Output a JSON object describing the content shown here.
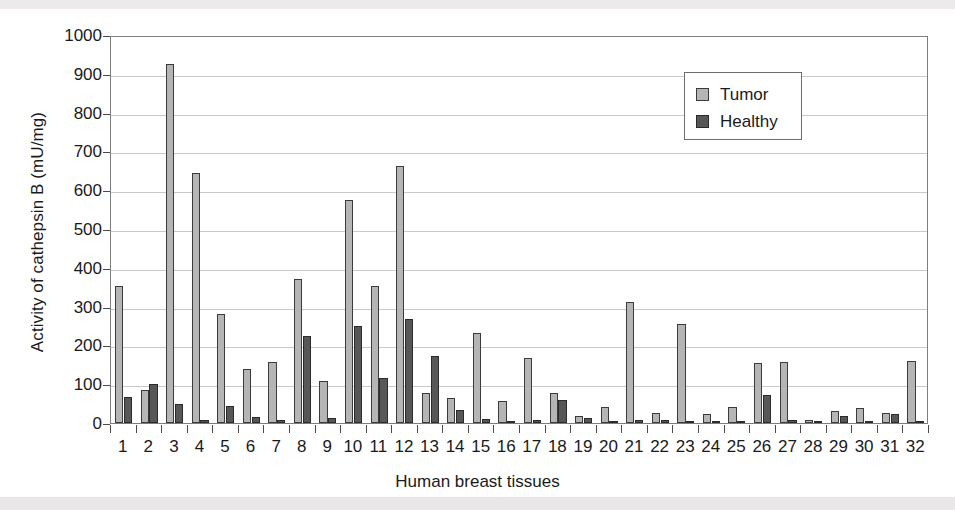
{
  "chart_data": {
    "type": "bar",
    "title": "",
    "xlabel": "Human breast tissues",
    "ylabel": "Activity of cathepsin B (mU/mg)",
    "ylim": [
      0,
      1000
    ],
    "ytick_step": 100,
    "yticks": [
      0,
      100,
      200,
      300,
      400,
      500,
      600,
      700,
      800,
      900,
      1000
    ],
    "grid": true,
    "legend_position": "upper right",
    "categories": [
      "1",
      "2",
      "3",
      "4",
      "5",
      "6",
      "7",
      "8",
      "9",
      "10",
      "11",
      "12",
      "13",
      "14",
      "15",
      "16",
      "17",
      "18",
      "19",
      "20",
      "21",
      "22",
      "23",
      "24",
      "25",
      "26",
      "27",
      "28",
      "29",
      "30",
      "31",
      "32"
    ],
    "series": [
      {
        "name": "Tumor",
        "color": "#b5b5b5",
        "values": [
          353,
          85,
          925,
          645,
          282,
          140,
          157,
          372,
          107,
          575,
          352,
          663,
          78,
          64,
          232,
          58,
          167,
          77,
          19,
          41,
          311,
          25,
          255,
          24,
          40,
          155,
          157,
          9,
          30,
          38,
          25,
          160
        ]
      },
      {
        "name": "Healthy",
        "color": "#575757",
        "values": [
          67,
          101,
          50,
          8,
          45,
          15,
          9,
          223,
          14,
          250,
          117,
          268,
          172,
          33,
          11,
          6,
          7,
          60,
          13,
          3,
          9,
          9,
          6,
          4,
          2,
          71,
          8,
          6,
          18,
          5,
          23,
          3
        ]
      }
    ]
  },
  "legend": {
    "items": [
      {
        "label": "Tumor",
        "swatch": "tumor"
      },
      {
        "label": "Healthy",
        "swatch": "healthy"
      }
    ]
  }
}
